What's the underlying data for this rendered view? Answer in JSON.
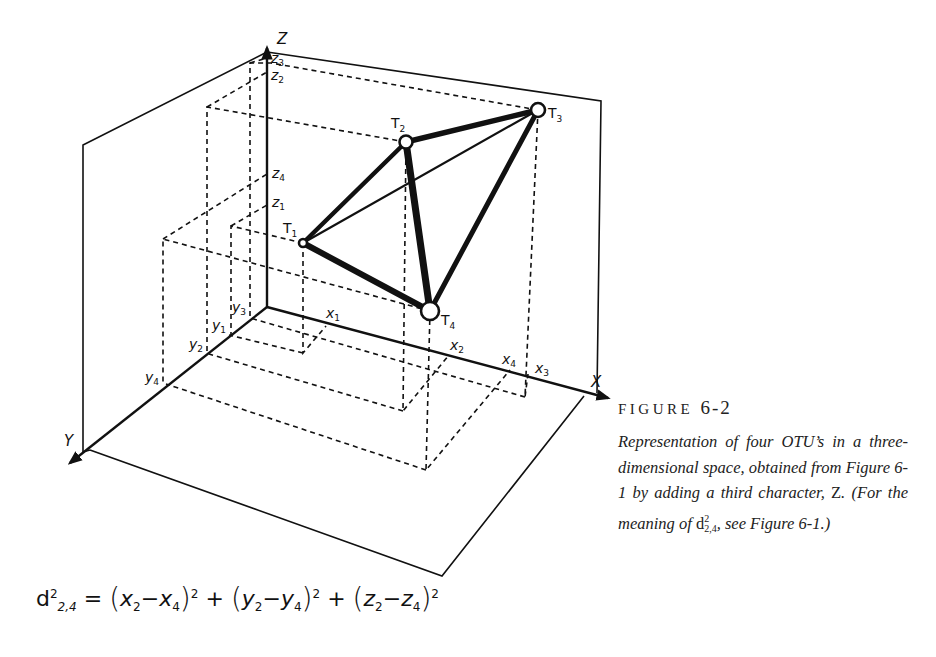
{
  "figure": {
    "label": "FIGURE",
    "number": "6-2",
    "caption_parts": {
      "p1": "Representation of four OTU’s in a three-dimensional space, obtained from Figure 6-1 by adding a third character, ",
      "z": "Z",
      "p2": ". (For the meaning of ",
      "d": "d",
      "d_sup": "2",
      "d_sub": "2,4",
      "p3": ", see Figure 6-1.)"
    }
  },
  "axes": {
    "x": "X",
    "y": "Y",
    "z": "Z"
  },
  "points": [
    {
      "id": "T1",
      "label": "T",
      "sub": "1"
    },
    {
      "id": "T2",
      "label": "T",
      "sub": "2"
    },
    {
      "id": "T3",
      "label": "T",
      "sub": "3"
    },
    {
      "id": "T4",
      "label": "T",
      "sub": "4"
    }
  ],
  "ticks": {
    "x": [
      {
        "label": "x",
        "sub": "1"
      },
      {
        "label": "x",
        "sub": "2"
      },
      {
        "label": "x",
        "sub": "4"
      },
      {
        "label": "x",
        "sub": "3"
      }
    ],
    "y": [
      {
        "label": "y",
        "sub": "3"
      },
      {
        "label": "y",
        "sub": "1"
      },
      {
        "label": "y",
        "sub": "2"
      },
      {
        "label": "y",
        "sub": "4"
      }
    ],
    "z": [
      {
        "label": "z",
        "sub": "3"
      },
      {
        "label": "z",
        "sub": "2"
      },
      {
        "label": "z",
        "sub": "4"
      },
      {
        "label": "z",
        "sub": "1"
      }
    ]
  },
  "formula": {
    "lhs": "d",
    "lhs_sup": "2",
    "lhs_sub": "2,4",
    "eq": "=",
    "terms": [
      {
        "a": "x",
        "a_sub": "2",
        "b": "x",
        "b_sub": "4",
        "exp": "2"
      },
      {
        "a": "y",
        "a_sub": "2",
        "b": "y",
        "b_sub": "4",
        "exp": "2"
      },
      {
        "a": "z",
        "a_sub": "2",
        "b": "z",
        "b_sub": "4",
        "exp": "2"
      }
    ],
    "minus": "−",
    "plus": "+"
  },
  "colors": {
    "ink": "#111111",
    "paper": "#ffffff"
  }
}
